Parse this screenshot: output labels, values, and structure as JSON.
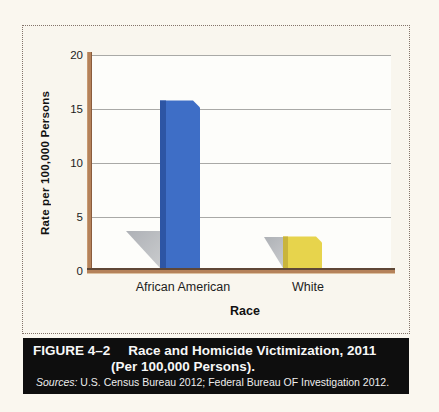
{
  "figure": {
    "label": "FIGURE 4–2",
    "title": "Race and Homicide Victimization, 2011",
    "subtitle": "(Per 100,000 Persons).",
    "sources_label": "Sources:",
    "sources_text": " U.S. Census Bureau 2012; Federal Bureau OF Investigation 2012."
  },
  "chart_data": {
    "type": "bar",
    "categories": [
      "African American",
      "White"
    ],
    "values": [
      15.8,
      3.2
    ],
    "title": "",
    "xlabel": "Race",
    "ylabel": "Rate per 100,000 Persons",
    "ylim": [
      0,
      20
    ],
    "yticks": [
      "20",
      "15",
      "10",
      "5",
      "0"
    ],
    "grid": true,
    "legend": "none",
    "style": "3d-bars-with-floor-shadows",
    "bar_colors": [
      "#3e6ec6",
      "#e7d44c"
    ],
    "bar_side_colors": [
      "#2d55a4",
      "#c9b43c"
    ]
  },
  "colors": {
    "page_background": "#faf7ef",
    "plot_background": "#fdfdfa",
    "axis_tan": "#b5825a",
    "axis_dark_edge": "#5f4736",
    "gridline": "#a9a9a6",
    "shadow_gray": "#b4b7bb",
    "dotted_border": "#83746a",
    "caption_background": "#0e0e0e",
    "caption_text": "#f7f7f7"
  }
}
